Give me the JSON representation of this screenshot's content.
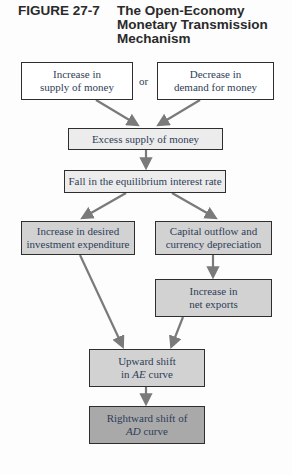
{
  "figure": {
    "number": "FIGURE 27-7",
    "title_lines": [
      "The Open-Economy",
      "Monetary Transmission",
      "Mechanism"
    ]
  },
  "connector": "or",
  "boxes": {
    "increase_supply": {
      "line1": "Increase in",
      "line2": "supply of money"
    },
    "decrease_demand": {
      "line1": "Decrease in",
      "line2": "demand for money"
    },
    "excess_supply": {
      "line1": "Excess supply of money"
    },
    "fall_interest": {
      "line1": "Fall in the equilibrium interest rate"
    },
    "investment": {
      "line1": "Increase in desired",
      "line2": "investment expenditure"
    },
    "capital_outflow": {
      "line1": "Capital outflow and",
      "line2": "currency depreciation"
    },
    "net_exports": {
      "line1": "Increase in",
      "line2": "net exports"
    },
    "ae_shift": {
      "line1": "Upward shift",
      "line2_pre": "in ",
      "line2_italic": "AE",
      "line2_post": " curve"
    },
    "ad_shift": {
      "line1": "Rightward shift of",
      "line2_italic": "AD",
      "line2_post": " curve"
    }
  },
  "colors": {
    "text": "#2f3e58",
    "arrow": "#7a7a7a",
    "box_light": "#ececec",
    "box_mid": "#d2d2d2",
    "box_dark": "#a9a9a9"
  }
}
